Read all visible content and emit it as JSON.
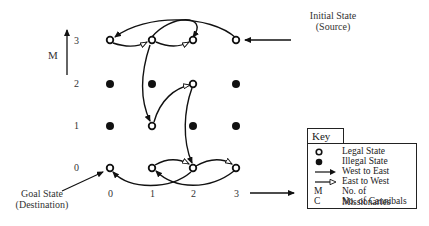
{
  "axes": {
    "y_label": "M",
    "x_label": "C",
    "y_ticks": [
      "3",
      "2",
      "1",
      "0"
    ],
    "x_ticks": [
      "0",
      "1",
      "2",
      "3"
    ]
  },
  "annotations": {
    "initial_state": "Initial State",
    "initial_state_sub": "(Source)",
    "goal_state": "Goal State",
    "goal_state_sub": "(Destination)"
  },
  "grid": {
    "rows": [
      {
        "m": 3,
        "states": [
          "legal",
          "legal",
          "legal",
          "legal"
        ]
      },
      {
        "m": 2,
        "states": [
          "illegal",
          "illegal",
          "legal",
          "illegal"
        ]
      },
      {
        "m": 1,
        "states": [
          "illegal",
          "legal",
          "illegal",
          "illegal"
        ]
      },
      {
        "m": 0,
        "states": [
          "legal",
          "legal",
          "legal",
          "legal"
        ]
      }
    ]
  },
  "transitions": [
    {
      "from": [
        3,
        3
      ],
      "to": [
        3,
        1
      ],
      "direction": "West to East"
    },
    {
      "from": [
        3,
        1
      ],
      "to": [
        3,
        2
      ],
      "direction": "East to West"
    },
    {
      "from": [
        3,
        2
      ],
      "to": [
        3,
        0
      ],
      "direction": "West to East"
    },
    {
      "from": [
        3,
        0
      ],
      "to": [
        3,
        1
      ],
      "direction": "East to West"
    },
    {
      "from": [
        3,
        1
      ],
      "to": [
        1,
        1
      ],
      "direction": "West to East"
    },
    {
      "from": [
        1,
        1
      ],
      "to": [
        2,
        2
      ],
      "direction": "East to West"
    },
    {
      "from": [
        2,
        2
      ],
      "to": [
        0,
        2
      ],
      "direction": "West to East"
    },
    {
      "from": [
        0,
        2
      ],
      "to": [
        0,
        3
      ],
      "direction": "East to West"
    },
    {
      "from": [
        0,
        3
      ],
      "to": [
        0,
        1
      ],
      "direction": "West to East"
    },
    {
      "from": [
        0,
        1
      ],
      "to": [
        0,
        2
      ],
      "direction": "East to West"
    },
    {
      "from": [
        0,
        2
      ],
      "to": [
        0,
        0
      ],
      "direction": "West to East"
    }
  ],
  "key": {
    "title": "Key",
    "items": [
      {
        "symbol": "legal-state",
        "label": "Legal State"
      },
      {
        "symbol": "illegal-state",
        "label": "Illegal State"
      },
      {
        "symbol": "west-to-east-arrow",
        "label": "West to East"
      },
      {
        "symbol": "east-to-west-arrow",
        "label": "East to West"
      },
      {
        "symbol": "M",
        "label": "No. of Missionaries"
      },
      {
        "symbol": "C",
        "label": "No. of Cannibals"
      }
    ]
  },
  "colors": {
    "ink": "#111111",
    "text": "#333333",
    "background": "#ffffff"
  }
}
